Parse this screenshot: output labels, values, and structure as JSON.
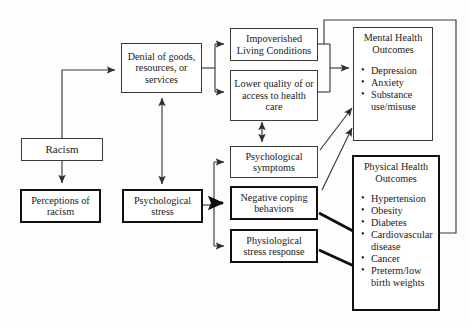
{
  "diagram": {
    "nodes": {
      "racism": {
        "lines": [
          "Racism"
        ]
      },
      "denial": {
        "lines": [
          "Denial of goods,",
          "resources, or",
          "services"
        ]
      },
      "perceptions": {
        "lines": [
          "Perceptions of",
          "racism"
        ]
      },
      "psych_stress": {
        "lines": [
          "Psychological",
          "stress"
        ]
      },
      "impoverished": {
        "lines": [
          "Impoverished",
          "Living Conditions"
        ]
      },
      "lower_quality": {
        "lines": [
          "Lower quality of or",
          "access to health",
          "care"
        ]
      },
      "psych_symptoms": {
        "lines": [
          "Psychological",
          "symptoms"
        ]
      },
      "negative_coping": {
        "lines": [
          "Negative coping",
          "behaviors"
        ]
      },
      "physiological": {
        "lines": [
          "Physiological",
          "stress response"
        ]
      }
    },
    "outcomes": {
      "mental": {
        "title_lines": [
          "Mental Health",
          "Outcomes"
        ],
        "items": [
          {
            "text": "Depression",
            "cont": ""
          },
          {
            "text": "Anxiety",
            "cont": ""
          },
          {
            "text": "Substance",
            "cont": "use/misuse"
          }
        ]
      },
      "physical": {
        "title_lines": [
          "Physical Health",
          "Outcomes"
        ],
        "items": [
          {
            "text": "Hypertension",
            "cont": ""
          },
          {
            "text": "Obesity",
            "cont": ""
          },
          {
            "text": "Diabetes",
            "cont": ""
          },
          {
            "text": "Cardiovascular",
            "cont": "disease"
          },
          {
            "text": "Cancer",
            "cont": ""
          },
          {
            "text": "Preterm/low",
            "cont": "birth weights"
          }
        ]
      }
    },
    "bullet_glyph": "•",
    "colors": {
      "background": "#fdfdfd",
      "thin_stroke": "#3a3a3a",
      "thick_stroke": "#111111",
      "text": "#1a1a1a"
    }
  }
}
